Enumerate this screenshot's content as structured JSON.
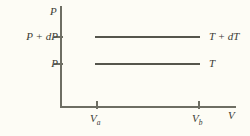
{
  "figure": {
    "kind": "pressure-volume-isotherm-diagram",
    "background_color": "#fdfcf5",
    "axis_color": "#6e6e63",
    "curve_color": "#55554c"
  },
  "axes": {
    "y_axis_label": "P",
    "x_axis_label": "V",
    "y_ticks": [
      {
        "label_main": "P",
        "label_operator": "+",
        "label_term": "dP",
        "position": "upper"
      },
      {
        "label_main": "P",
        "label_operator": "",
        "label_term": "",
        "position": "lower"
      }
    ],
    "x_ticks": [
      {
        "base": "V",
        "sub": "a"
      },
      {
        "base": "V",
        "sub": "b"
      }
    ]
  },
  "curves": [
    {
      "name": "upper-isotherm",
      "label_main": "T",
      "label_operator": "+",
      "label_term": "dT",
      "pressure_label": "P + dP",
      "temperature_label": "T + dT"
    },
    {
      "name": "lower-isotherm",
      "label_main": "T",
      "label_operator": "",
      "label_term": "",
      "pressure_label": "P",
      "temperature_label": "T"
    }
  ],
  "chart_data": {
    "type": "line",
    "title": "",
    "xlabel": "V",
    "ylabel": "P",
    "grid": false,
    "legend": "right-of-curve-endpoints",
    "xlim": [
      0,
      1
    ],
    "ylim": [
      0,
      1
    ],
    "x_tick_labels": [
      "V_a",
      "V_b"
    ],
    "x_tick_values": [
      0.205,
      0.785
    ],
    "y_tick_labels": [
      "P",
      "P + dP"
    ],
    "y_tick_values": [
      0.42,
      0.69
    ],
    "series": [
      {
        "name": "T + dT",
        "comment": "upper isotherm, constant pressure P + dP",
        "x": [
          0.2,
          0.785
        ],
        "y": [
          0.69,
          0.69
        ]
      },
      {
        "name": "T",
        "comment": "lower isotherm, constant pressure P",
        "x": [
          0.2,
          0.785
        ],
        "y": [
          0.42,
          0.42
        ]
      }
    ]
  }
}
